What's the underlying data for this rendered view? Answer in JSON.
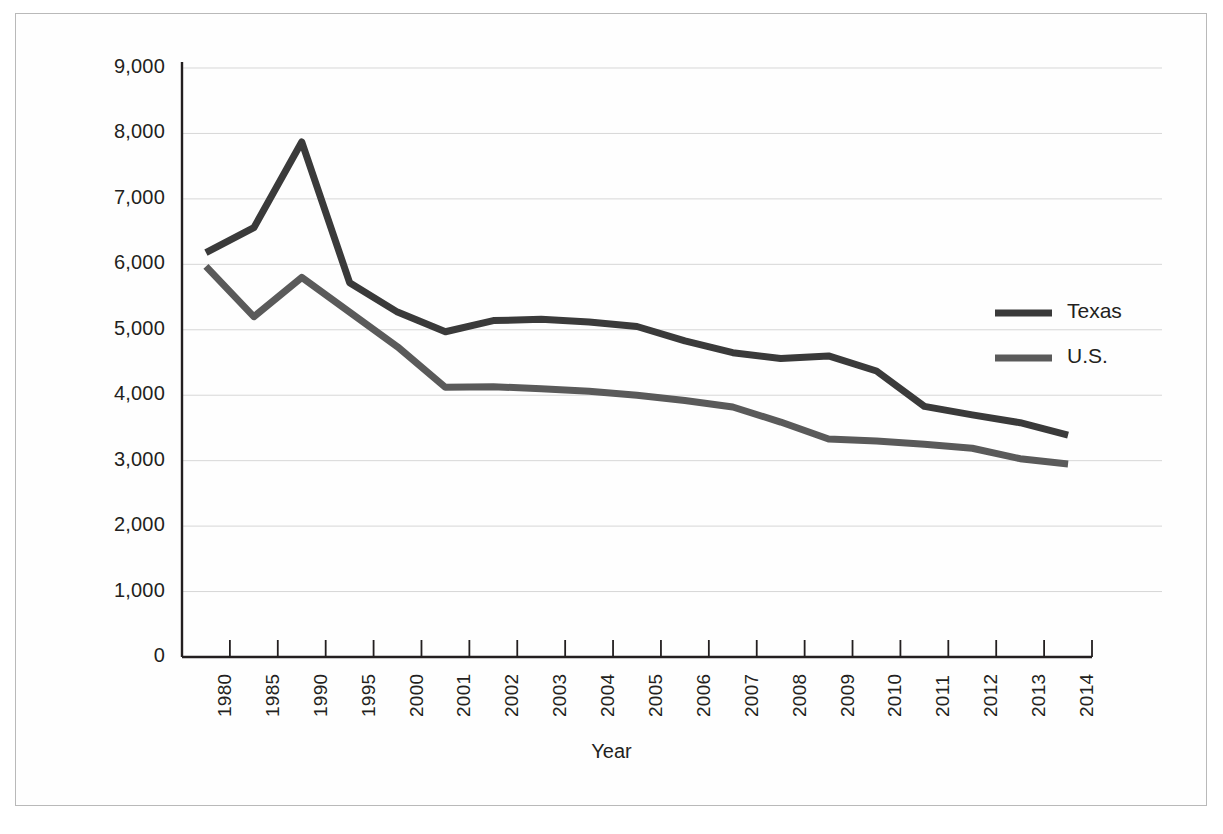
{
  "figure": {
    "background": "#fefefe",
    "border_color": "#b9b9b9"
  },
  "axis_title": "Year",
  "legend": {
    "position": "right-inside",
    "entries": [
      {
        "label": "Texas",
        "color": "#3a3a3a"
      },
      {
        "label": "U.S.",
        "color": "#5a5a5a"
      }
    ]
  },
  "chart_data": {
    "type": "line",
    "title": "",
    "subtitle": "",
    "xlabel": "Year",
    "ylabel": "",
    "grid": true,
    "ylim": [
      0,
      9000
    ],
    "ytick_labels": [
      "0",
      "1,000",
      "2,000",
      "3,000",
      "4,000",
      "5,000",
      "6,000",
      "7,000",
      "8,000",
      "9,000"
    ],
    "ytick_values": [
      0,
      1000,
      2000,
      3000,
      4000,
      5000,
      6000,
      7000,
      8000,
      9000
    ],
    "categories": [
      "1980",
      "1985",
      "1990",
      "1995",
      "2000",
      "2001",
      "2002",
      "2003",
      "2004",
      "2005",
      "2006",
      "2007",
      "2008",
      "2009",
      "2010",
      "2011",
      "2012",
      "2013",
      "2014"
    ],
    "series": [
      {
        "name": "Texas",
        "color": "#3a3a3a",
        "values": [
          6180,
          6560,
          7870,
          5720,
          5270,
          4970,
          5140,
          5160,
          5120,
          5050,
          4830,
          4650,
          4560,
          4600,
          4370,
          3830,
          3700,
          3580,
          3390
        ]
      },
      {
        "name": "U.S.",
        "color": "#5a5a5a",
        "values": [
          5970,
          5200,
          5800,
          5270,
          4740,
          4120,
          4130,
          4100,
          4060,
          4000,
          3920,
          3820,
          3590,
          3330,
          3300,
          3250,
          3190,
          3030,
          2950
        ]
      }
    ]
  }
}
